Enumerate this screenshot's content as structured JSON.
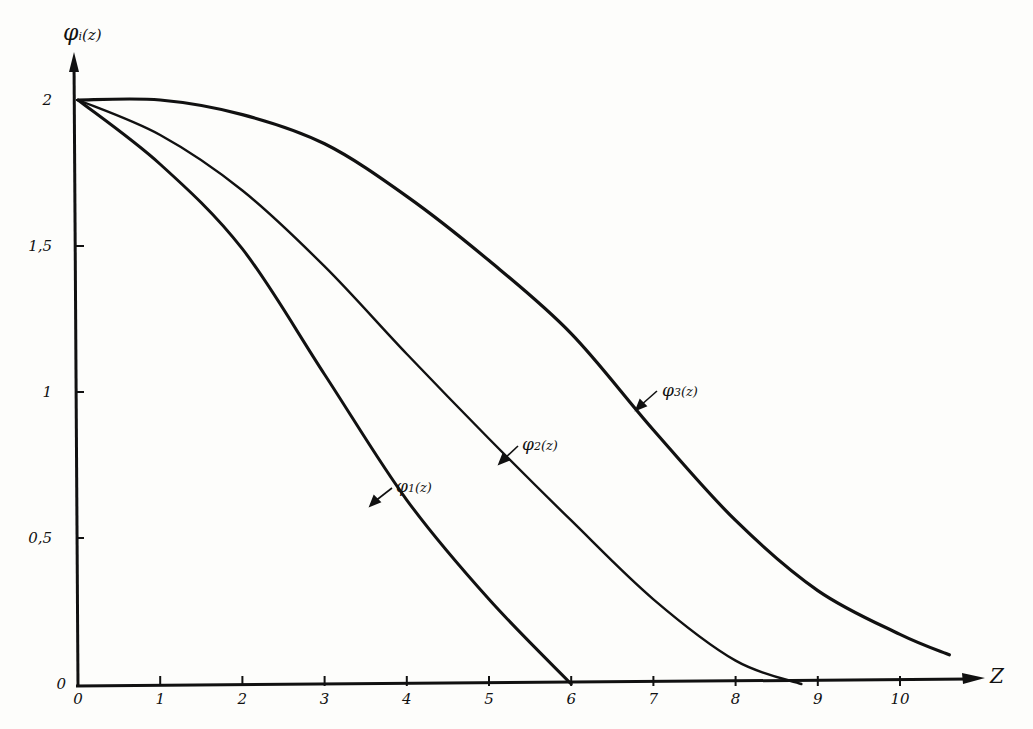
{
  "chart_data": {
    "type": "line",
    "title": "",
    "xlabel": "z",
    "ylabel": "φi(z)",
    "xlim": [
      0,
      10.9
    ],
    "ylim": [
      0,
      2.2
    ],
    "grid": false,
    "legend": "inline annotations with arrows",
    "x_ticks": [
      "0",
      "1",
      "2",
      "3",
      "4",
      "5",
      "6",
      "7",
      "8",
      "9",
      "10"
    ],
    "y_ticks": [
      "0",
      "0,5",
      "1",
      "1,5",
      "2"
    ],
    "series": [
      {
        "name": "φ1(z)",
        "x": [
          0,
          1,
          2,
          3,
          4,
          5,
          6
        ],
        "values": [
          2.0,
          1.78,
          1.49,
          1.06,
          0.63,
          0.29,
          0.0
        ]
      },
      {
        "name": "φ2(z)",
        "x": [
          0,
          1,
          2,
          3,
          4,
          5,
          6,
          7,
          8,
          8.8
        ],
        "values": [
          2.0,
          1.88,
          1.69,
          1.43,
          1.13,
          0.84,
          0.56,
          0.29,
          0.08,
          0.0
        ]
      },
      {
        "name": "φ3(z)",
        "x": [
          0,
          1,
          2,
          3,
          4,
          5,
          6,
          7,
          8,
          9,
          10,
          10.6
        ],
        "values": [
          2.0,
          2.0,
          1.95,
          1.85,
          1.67,
          1.45,
          1.2,
          0.87,
          0.56,
          0.32,
          0.17,
          0.1
        ]
      }
    ],
    "annotations": [
      {
        "text": "φ1(z)",
        "at": {
          "x": 3.6,
          "y": 0.6
        }
      },
      {
        "text": "φ2(z)",
        "at": {
          "x": 5.2,
          "y": 0.78
        }
      },
      {
        "text": "φ3(z)",
        "at": {
          "x": 6.8,
          "y": 0.95
        }
      }
    ]
  },
  "labels": {
    "y_axis": "φ",
    "y_axis_sub": "i",
    "y_axis_arg": "(z)",
    "x_axis": "Z",
    "origin_x": "0",
    "phi1": "φ",
    "phi1_sub": "1",
    "phi1_arg": "(z)",
    "phi2": "φ",
    "phi2_sub": "2",
    "phi2_arg": "(z)",
    "phi3": "φ",
    "phi3_sub": "3",
    "phi3_arg": "(z)"
  }
}
